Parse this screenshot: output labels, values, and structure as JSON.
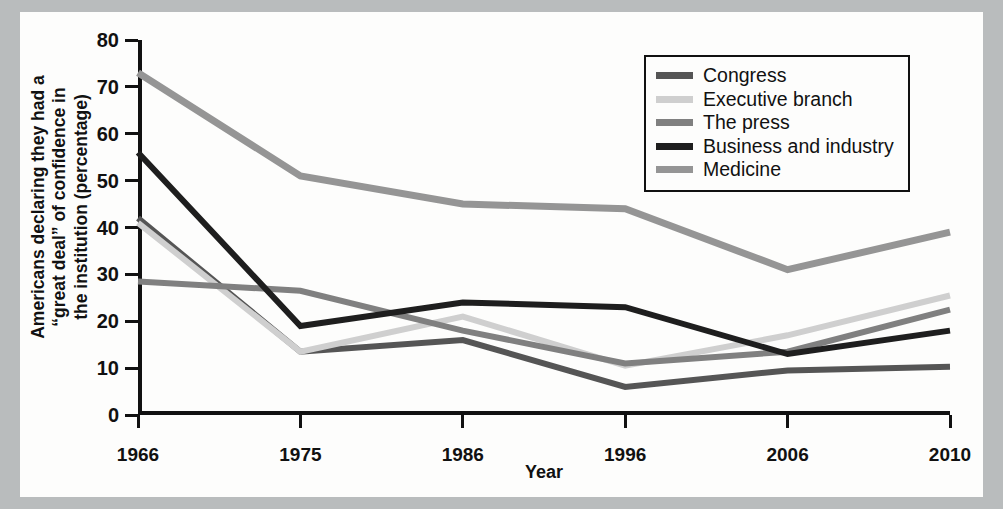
{
  "chart_data": {
    "type": "line",
    "title": "",
    "xlabel": "Year",
    "ylabel": "Americans declaring they had a “great deal” of confidence in the institution (percentage)",
    "ylabel_lines": [
      "Americans declaring they had a",
      "“great deal” of confidence in",
      "the institution (percentage)"
    ],
    "categories": [
      "1966",
      "1975",
      "1986",
      "1996",
      "2006",
      "2010"
    ],
    "x": [
      1966,
      1975,
      1986,
      1996,
      2006,
      2010
    ],
    "ylim": [
      0,
      80
    ],
    "yticks": [
      0,
      10,
      20,
      30,
      40,
      50,
      60,
      70,
      80
    ],
    "ytick_labels": [
      "0",
      "10",
      "20",
      "30",
      "40",
      "50",
      "60",
      "70",
      "80"
    ],
    "grid": false,
    "legend_position": "top-right",
    "series": [
      {
        "name": "Congress",
        "color": "#555555",
        "values": [
          42,
          13.5,
          16,
          6,
          9.5,
          10.3
        ]
      },
      {
        "name": "Executive branch",
        "color": "#cfcfcf",
        "values": [
          41,
          13.5,
          21,
          10.5,
          17,
          25.5
        ]
      },
      {
        "name": "The press",
        "color": "#808080",
        "values": [
          28.5,
          26.5,
          18,
          11,
          13.5,
          22.5
        ]
      },
      {
        "name": "Business and industry",
        "color": "#1e1e1e",
        "values": [
          56,
          19,
          24,
          23,
          13,
          18
        ]
      },
      {
        "name": "Medicine",
        "color": "#959595",
        "values": [
          73,
          51,
          45,
          44,
          31,
          39
        ]
      }
    ]
  },
  "axes": {
    "y_title_lines": [
      "Americans declaring they had a",
      "“great deal” of confidence in",
      "the institution (percentage)"
    ],
    "x_title": "Year"
  },
  "legend": {
    "items": [
      {
        "label": "Congress",
        "color": "#555555"
      },
      {
        "label": "Executive branch",
        "color": "#cfcfcf"
      },
      {
        "label": "The press",
        "color": "#808080"
      },
      {
        "label": "Business and industry",
        "color": "#1e1e1e"
      },
      {
        "label": "Medicine",
        "color": "#959595"
      }
    ]
  },
  "colors": {
    "background": "#b9bcbd",
    "figure": "#fdfdfc",
    "axis": "#111111"
  }
}
